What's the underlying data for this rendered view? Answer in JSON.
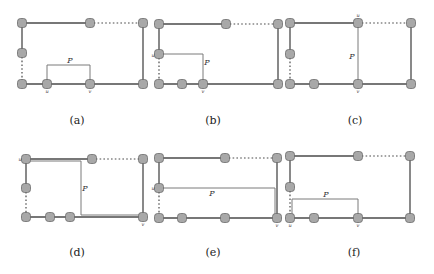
{
  "figure": {
    "panels": [
      {
        "id": "a",
        "caption": "(a)",
        "caption_pos": [
          77,
          124
        ],
        "nodes": [
          [
            22,
            23
          ],
          [
            90,
            23
          ],
          [
            143,
            23
          ],
          [
            22,
            53
          ],
          [
            22,
            84
          ],
          [
            47,
            84
          ],
          [
            90,
            84
          ],
          [
            143,
            84
          ]
        ],
        "solid_edges": [
          [
            [
              22,
              23
            ],
            [
              90,
              23
            ]
          ],
          [
            [
              22,
              23
            ],
            [
              22,
              53
            ]
          ],
          [
            [
              143,
              23
            ],
            [
              143,
              84
            ]
          ],
          [
            [
              22,
              84
            ],
            [
              143,
              84
            ]
          ]
        ],
        "dotted_edges": [
          [
            [
              90,
              23
            ],
            [
              143,
              23
            ]
          ],
          [
            [
              22,
              53
            ],
            [
              22,
              84
            ]
          ]
        ],
        "path": [
          [
            47,
            84
          ],
          [
            47,
            65
          ],
          [
            90,
            65
          ],
          [
            90,
            84
          ]
        ],
        "path_label": "P",
        "path_label_pos": [
          70,
          63
        ],
        "u_label": "u",
        "u_pos": [
          47,
          93
        ],
        "v_label": "v",
        "v_pos": [
          90,
          93
        ]
      },
      {
        "id": "b",
        "caption": "(b)",
        "caption_pos": [
          213,
          124
        ],
        "nodes": [
          [
            159,
            24
          ],
          [
            226,
            24
          ],
          [
            278,
            24
          ],
          [
            159,
            54
          ],
          [
            159,
            84
          ],
          [
            182,
            84
          ],
          [
            203,
            84
          ],
          [
            278,
            84
          ]
        ],
        "solid_edges": [
          [
            [
              159,
              24
            ],
            [
              226,
              24
            ]
          ],
          [
            [
              159,
              24
            ],
            [
              159,
              54
            ]
          ],
          [
            [
              278,
              24
            ],
            [
              278,
              84
            ]
          ],
          [
            [
              159,
              84
            ],
            [
              278,
              84
            ]
          ]
        ],
        "dotted_edges": [
          [
            [
              226,
              24
            ],
            [
              278,
              24
            ]
          ],
          [
            [
              159,
              54
            ],
            [
              159,
              84
            ]
          ]
        ],
        "path": [
          [
            159,
            54
          ],
          [
            203,
            54
          ],
          [
            203,
            84
          ]
        ],
        "path_label": "P",
        "path_label_pos": [
          207,
          65
        ],
        "u_label": "u",
        "u_pos": [
          153,
          57
        ],
        "v_label": "v",
        "v_pos": [
          203,
          93
        ]
      },
      {
        "id": "c",
        "caption": "(c)",
        "caption_pos": [
          355,
          124
        ],
        "nodes": [
          [
            290,
            23
          ],
          [
            358,
            23
          ],
          [
            411,
            23
          ],
          [
            290,
            54
          ],
          [
            290,
            84
          ],
          [
            314,
            84
          ],
          [
            358,
            84
          ],
          [
            411,
            84
          ]
        ],
        "solid_edges": [
          [
            [
              290,
              23
            ],
            [
              358,
              23
            ]
          ],
          [
            [
              290,
              23
            ],
            [
              290,
              54
            ]
          ],
          [
            [
              411,
              23
            ],
            [
              411,
              84
            ]
          ],
          [
            [
              290,
              84
            ],
            [
              358,
              84
            ]
          ],
          [
            [
              358,
              84
            ],
            [
              411,
              84
            ]
          ]
        ],
        "dotted_edges": [
          [
            [
              358,
              23
            ],
            [
              411,
              23
            ]
          ],
          [
            [
              290,
              54
            ],
            [
              290,
              84
            ]
          ]
        ],
        "path": [
          [
            358,
            23
          ],
          [
            358,
            84
          ]
        ],
        "path_label": "P",
        "path_label_pos": [
          352,
          59
        ],
        "u_label": "u",
        "u_pos": [
          358,
          17
        ],
        "v_label": "v",
        "v_pos": [
          358,
          93
        ]
      },
      {
        "id": "d",
        "caption": "(d)",
        "caption_pos": [
          77,
          256
        ],
        "nodes": [
          [
            26,
            159
          ],
          [
            92,
            159
          ],
          [
            143,
            159
          ],
          [
            26,
            188
          ],
          [
            26,
            217
          ],
          [
            50,
            217
          ],
          [
            70,
            217
          ],
          [
            143,
            217
          ]
        ],
        "solid_edges": [
          [
            [
              26,
              159
            ],
            [
              92,
              159
            ]
          ],
          [
            [
              26,
              159
            ],
            [
              26,
              188
            ]
          ],
          [
            [
              143,
              159
            ],
            [
              143,
              217
            ]
          ],
          [
            [
              26,
              217
            ],
            [
              143,
              217
            ]
          ]
        ],
        "dotted_edges": [
          [
            [
              92,
              159
            ],
            [
              143,
              159
            ]
          ],
          [
            [
              26,
              188
            ],
            [
              26,
              217
            ]
          ]
        ],
        "path": [
          [
            26,
            161
          ],
          [
            81,
            161
          ],
          [
            81,
            215
          ],
          [
            143,
            215
          ]
        ],
        "path_label": "P",
        "path_label_pos": [
          85,
          191
        ],
        "u_label": "u",
        "u_pos": [
          20,
          161
        ],
        "v_label": "v",
        "v_pos": [
          143,
          226
        ]
      },
      {
        "id": "e",
        "caption": "(e)",
        "caption_pos": [
          213,
          256
        ],
        "nodes": [
          [
            159,
            158
          ],
          [
            225,
            158
          ],
          [
            277,
            158
          ],
          [
            159,
            188
          ],
          [
            159,
            218
          ],
          [
            182,
            218
          ],
          [
            225,
            218
          ],
          [
            277,
            218
          ]
        ],
        "solid_edges": [
          [
            [
              159,
              158
            ],
            [
              225,
              158
            ]
          ],
          [
            [
              159,
              158
            ],
            [
              159,
              188
            ]
          ],
          [
            [
              277,
              158
            ],
            [
              277,
              218
            ]
          ],
          [
            [
              159,
              218
            ],
            [
              277,
              218
            ]
          ]
        ],
        "dotted_edges": [
          [
            [
              225,
              158
            ],
            [
              277,
              158
            ]
          ],
          [
            [
              159,
              188
            ],
            [
              159,
              218
            ]
          ]
        ],
        "path": [
          [
            159,
            188
          ],
          [
            275,
            188
          ],
          [
            275,
            218
          ]
        ],
        "path_label": "P",
        "path_label_pos": [
          212,
          196
        ],
        "u_label": "u",
        "u_pos": [
          153,
          190
        ],
        "v_label": "v",
        "v_pos": [
          277,
          227
        ]
      },
      {
        "id": "f",
        "caption": "(f)",
        "caption_pos": [
          354,
          256
        ],
        "nodes": [
          [
            290,
            156
          ],
          [
            358,
            156
          ],
          [
            410,
            156
          ],
          [
            290,
            187
          ],
          [
            290,
            218
          ],
          [
            314,
            218
          ],
          [
            358,
            218
          ],
          [
            410,
            218
          ]
        ],
        "solid_edges": [
          [
            [
              290,
              156
            ],
            [
              358,
              156
            ]
          ],
          [
            [
              290,
              156
            ],
            [
              290,
              187
            ]
          ],
          [
            [
              410,
              156
            ],
            [
              410,
              218
            ]
          ],
          [
            [
              290,
              218
            ],
            [
              410,
              218
            ]
          ]
        ],
        "dotted_edges": [
          [
            [
              358,
              156
            ],
            [
              410,
              156
            ]
          ],
          [
            [
              290,
              187
            ],
            [
              290,
              218
            ]
          ]
        ],
        "path": [
          [
            292,
            218
          ],
          [
            292,
            199
          ],
          [
            358,
            199
          ],
          [
            358,
            218
          ]
        ],
        "path_label": "P",
        "path_label_pos": [
          326,
          197
        ],
        "u_label": "u",
        "u_pos": [
          290,
          227
        ],
        "v_label": "v",
        "v_pos": [
          358,
          227
        ]
      }
    ]
  }
}
